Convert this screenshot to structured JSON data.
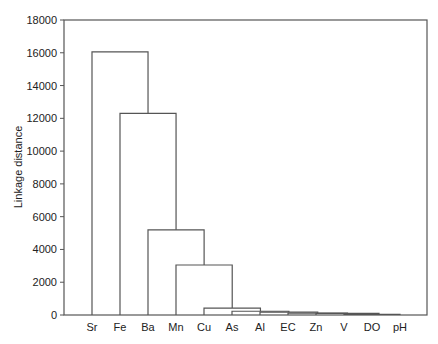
{
  "chart_data": {
    "type": "dendrogram",
    "title": "",
    "xlabel": "",
    "ylabel": "Linkage distance",
    "ylim": [
      0,
      18000
    ],
    "yticks": [
      0,
      2000,
      4000,
      6000,
      8000,
      10000,
      12000,
      14000,
      16000,
      18000
    ],
    "leaves": [
      "Sr",
      "Fe",
      "Ba",
      "Mn",
      "Cu",
      "As",
      "Al",
      "EC",
      "Zn",
      "V",
      "DO",
      "pH"
    ],
    "merges": [
      {
        "left": "V",
        "right": "DO",
        "height": 30
      },
      {
        "left": "V+DO",
        "right": "pH",
        "height": 40
      },
      {
        "left": "Zn",
        "right": "V+DO+pH",
        "height": 100
      },
      {
        "left": "EC",
        "right": "Zn+V+DO+pH",
        "height": 120
      },
      {
        "left": "Al",
        "right": "EC+Zn+V+DO+pH",
        "height": 170
      },
      {
        "left": "As",
        "right": "Al+EC+Zn+V+DO+pH",
        "height": 230
      },
      {
        "left": "Cu",
        "right": "As+Al+EC+Zn+V+DO+pH",
        "height": 420
      },
      {
        "left": "Mn",
        "right": "Cu+...",
        "height": 3050
      },
      {
        "left": "Ba",
        "right": "Mn+...",
        "height": 5200
      },
      {
        "left": "Fe",
        "right": "Ba+...",
        "height": 12300
      },
      {
        "left": "Sr",
        "right": "Fe+...",
        "height": 16050
      }
    ],
    "grid": false,
    "legend": "none"
  }
}
